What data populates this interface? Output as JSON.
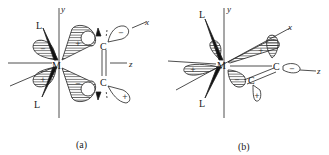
{
  "figure": {
    "panels": [
      {
        "id": "a",
        "caption": "(a)",
        "metal": "M",
        "ligands": [
          "L",
          "L"
        ],
        "carbons": [
          "C",
          "C"
        ],
        "axes": {
          "x": "x",
          "y": "y",
          "z": "z"
        },
        "lobe_signs": {
          "metal_upper_left": "−",
          "metal_upper_right": "+",
          "metal_lower_left": "+",
          "metal_lower_right": "−",
          "carbon_upper": "−",
          "carbon_lower": "+"
        }
      },
      {
        "id": "b",
        "caption": "(b)",
        "metal": "M",
        "ligands": [
          "L",
          "L"
        ],
        "carbons": [
          "C",
          "C"
        ],
        "axes": {
          "x": "x",
          "y": "y",
          "z": "z"
        },
        "lobe_signs": {
          "metal_upper_left": "−",
          "metal_left": "+",
          "metal_upper_right": "+",
          "metal_lower_right": "−",
          "carbon_right": "−",
          "carbon_lower": "+"
        }
      }
    ]
  },
  "colors": {
    "ink": "#222222",
    "background": "#ffffff"
  }
}
